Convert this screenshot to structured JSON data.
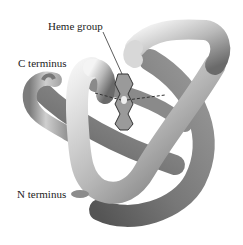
{
  "figure": {
    "labels": {
      "heme_group": "Heme group",
      "c_terminus": "C terminus",
      "n_terminus": "N terminus"
    },
    "colors": {
      "tube_light": "#f2f2f2",
      "tube_mid": "#b5b5b5",
      "tube_dark": "#6e6e6e",
      "heme_fill": "#9a9a9a",
      "leader_line": "#333333",
      "background": "#ffffff"
    }
  }
}
